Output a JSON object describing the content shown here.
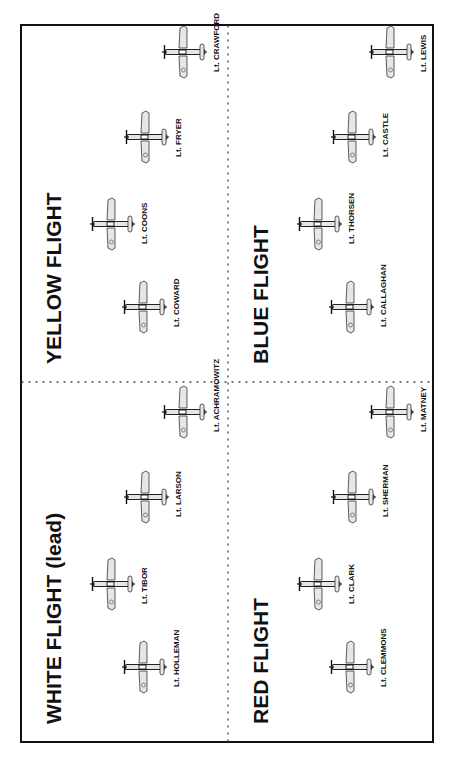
{
  "diagram": {
    "orientation": "rotated-counterclockwise",
    "colors": {
      "frame": "#111111",
      "plane_fill": "#e6e6e6",
      "plane_stroke": "#222222",
      "divider": "#444444"
    },
    "flights": [
      {
        "id": "white",
        "title": "WHITE FLIGHT (lead)",
        "quadrant": "top-left",
        "pilots": [
          "Lt. HOLLEMAN",
          "Lt. TIBOR",
          "Lt. LARSON",
          "Lt. ACHRAMOWITZ"
        ]
      },
      {
        "id": "yellow",
        "title": "YELLOW FLIGHT",
        "quadrant": "top-right",
        "pilots": [
          "Lt. COWARD",
          "Lt. COONS",
          "Lt. FRYER",
          "Lt. CRAWFORD"
        ]
      },
      {
        "id": "red",
        "title": "RED FLIGHT",
        "quadrant": "bottom-left",
        "pilots": [
          "Lt. CLEMMONS",
          "Lt. CLARK",
          "Lt. SHERMAN",
          "Lt. MATNEY"
        ]
      },
      {
        "id": "blue",
        "title": "BLUE FLIGHT",
        "quadrant": "bottom-right",
        "pilots": [
          "Lt. CALLAGHAN",
          "Lt. THORSEN",
          "Lt. CASTLE",
          "Lt. LEWIS"
        ]
      }
    ],
    "aircraft_icon": "fighter-plane-top-view-icon"
  }
}
